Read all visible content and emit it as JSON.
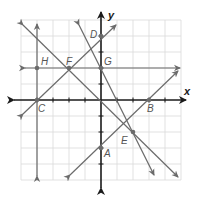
{
  "diagram": {
    "type": "coordinate-plane",
    "axes": {
      "x_label": "x",
      "y_label": "y",
      "x_range": [
        -5,
        5
      ],
      "y_range": [
        -5,
        5
      ],
      "grid": true
    },
    "points": [
      {
        "label": "A",
        "x": 0,
        "y": -3
      },
      {
        "label": "B",
        "x": 3,
        "y": 0
      },
      {
        "label": "C",
        "x": -4,
        "y": 0
      },
      {
        "label": "D",
        "x": 0,
        "y": 4
      },
      {
        "label": "E",
        "x": 2,
        "y": -2
      },
      {
        "label": "F",
        "x": -2,
        "y": 2
      },
      {
        "label": "G",
        "x": 0,
        "y": 2
      },
      {
        "label": "H",
        "x": -4,
        "y": 2
      }
    ],
    "lines": [
      {
        "name": "line-HC",
        "equation": "x = -4"
      },
      {
        "name": "line-HFG",
        "equation": "y = 2"
      },
      {
        "name": "line-CFD",
        "equation": "y = x + 4"
      },
      {
        "name": "line-AB",
        "equation": "y = x - 3"
      },
      {
        "name": "line-FE",
        "equation": "y = -x"
      },
      {
        "name": "line-GE",
        "equation": "y = -2x + 2"
      }
    ],
    "colors": {
      "line": "#6b6b6b",
      "axis": "#1a1a1a",
      "grid": "#d9d9d9",
      "label": "#555555"
    }
  }
}
